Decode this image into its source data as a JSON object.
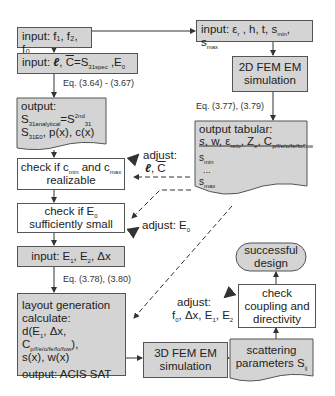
{
  "boxes": {
    "input_freq": {
      "prefix": "input: ",
      "text": "f₁, f₂, f₀"
    },
    "input_spec": {
      "prefix": "input: ",
      "l": "ℓ",
      "c": "C",
      "eq": "=S",
      "sub": "31spec",
      "tail": " ,E",
      "sub2": "0"
    },
    "eq_364": "Eq. (3.64) - (3.67)",
    "output_analytic": {
      "title": "output:",
      "l1a": "S",
      "l1sub": "31analytical",
      "l1b": "=S",
      "l1sup": "2nd",
      "l1sub2": "31",
      "l2a": "S",
      "l2sub": "31E0",
      "l2b": ", p(x), c(x)"
    },
    "check_c": {
      "l1a": "check if c",
      "sub1": "min",
      "l1b": " and c",
      "sub2": "max",
      "l2": "realizable"
    },
    "check_e0": {
      "l1a": "check if E",
      "sub1": "0",
      "l2": "sufficiently small"
    },
    "input_e": {
      "text": "input: E",
      "s1": "1",
      "m": ", E",
      "s2": "2",
      "t": ", Δx"
    },
    "eq_378": "Eq. (3.78), (3.80)",
    "layout": {
      "l1": "layout generation",
      "l2": "calculate:",
      "l3a": "d(E",
      "l3s": "1",
      "l3b": ", Δx, C",
      "l3s2": "p/f/e/o/fe/fo/fow",
      "l3c": "),",
      "l4": "s(x), w(x)",
      "l5": "output: ACIS SAT"
    },
    "fem3d": {
      "l1": "3D FEM EM",
      "l2": "simulation"
    },
    "scatter": {
      "l1": "scattering",
      "l2": "parameters S",
      "sub": "ij"
    },
    "check_coupling": {
      "l1": "check",
      "l2": "coupling and",
      "l3": "directivity"
    },
    "success": {
      "l1": "successful",
      "l2": "design"
    },
    "input_sub": {
      "a": "input: ε",
      "s1": "r",
      "b": " , h, t, s",
      "s2": "min",
      "c": ", s",
      "s3": "max"
    },
    "fem2d": {
      "l1": "2D FEM EM",
      "l2": "simulation"
    },
    "eq_377": "Eq. (3.77), (3.79)",
    "tabular": {
      "title": "output tabular:",
      "h_s": "s",
      "h_w": ", w, ε",
      "h_ws": "re/o",
      "h_z": ", Z",
      "h_zs": "e",
      "h_c": ", C",
      "h_cs": "p/f/e/o/fe/fo/fow",
      "r1": "s",
      "r1s": "min",
      "dots": "...",
      "r3": "s",
      "r3s": "max"
    }
  },
  "adjust": {
    "lc": {
      "l1": "adjust:",
      "l": "ℓ",
      "c": "C"
    },
    "e0": {
      "a": "adjust: E",
      "s": "0"
    },
    "final": {
      "l1": "adjust:",
      "a": "f",
      "s0": "0",
      "b": ", Δx, E",
      "s1": "1",
      "c": ", E",
      "s2": "2"
    }
  },
  "colors": {
    "shaded": "#d4d4d4",
    "border": "#555555",
    "white": "#ffffff"
  }
}
